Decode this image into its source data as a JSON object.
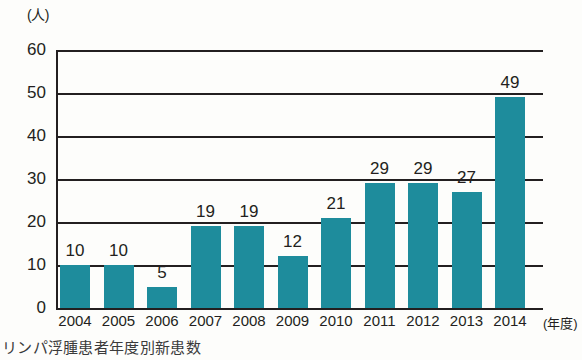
{
  "caption": "リンパ浮腫患者年度別新患数",
  "axis": {
    "y_unit": "(人)",
    "x_unit": "(年度)"
  },
  "chart_data": {
    "type": "bar",
    "title": "リンパ浮腫患者年度別新患数",
    "xlabel": "(年度)",
    "ylabel": "(人)",
    "ylim": [
      0,
      60
    ],
    "yticks": [
      0,
      10,
      20,
      30,
      40,
      50,
      60
    ],
    "grid": true,
    "legend": "none",
    "bar_color": "#1e8c9c",
    "categories": [
      "2004",
      "2005",
      "2006",
      "2007",
      "2008",
      "2009",
      "2010",
      "2011",
      "2012",
      "2013",
      "2014"
    ],
    "values": [
      10,
      10,
      5,
      19,
      19,
      12,
      21,
      29,
      29,
      27,
      49
    ],
    "data_labels": [
      "10",
      "10",
      "5",
      "19",
      "19",
      "12",
      "21",
      "29",
      "29",
      "27",
      "49"
    ]
  }
}
